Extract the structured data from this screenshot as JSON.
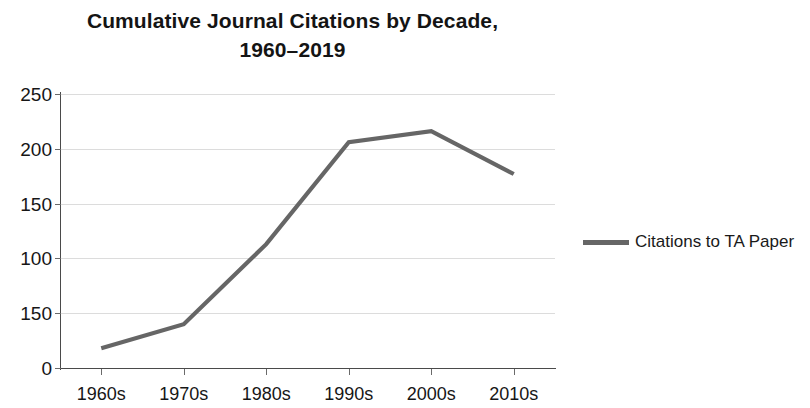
{
  "chart_data": {
    "type": "line",
    "title": "Cumulative Journal Citations by Decade, 1960–2019",
    "title_lines": [
      "Cumulative Journal Citations by Decade,",
      "1960–2019"
    ],
    "categories": [
      "1960s",
      "1970s",
      "1980s",
      "1990s",
      "2000s",
      "2010s"
    ],
    "series": [
      {
        "name": "Citations to TA Paper",
        "values": [
          18,
          40,
          113,
          206,
          216,
          177
        ],
        "color": "#666666"
      }
    ],
    "xlabel": "",
    "ylabel": "",
    "ylim": [
      0,
      250
    ],
    "ytick_values": [
      250,
      200,
      150,
      100,
      50,
      0
    ],
    "ytick_labels": [
      "250",
      "200",
      "150",
      "100",
      "150",
      "0"
    ],
    "grid": true,
    "grid_color": "#dcdcdc",
    "legend_position": "right",
    "legend_entries": [
      "Citations to TA Paper"
    ],
    "axis_color": "#4a4a4a",
    "background_color": "#ffffff"
  },
  "legend": {
    "label": "Citations to TA Paper"
  }
}
